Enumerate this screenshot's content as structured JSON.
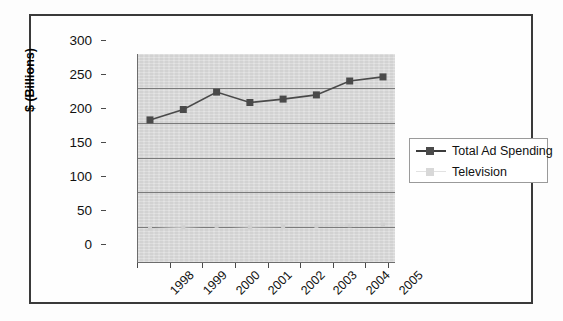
{
  "chart_data": {
    "type": "line",
    "title": "",
    "xlabel": "",
    "ylabel": "$ (Billions)",
    "categories": [
      "1998",
      "1999",
      "2000",
      "2001",
      "2002",
      "2003",
      "2004",
      "2005"
    ],
    "ylim": [
      0,
      300
    ],
    "ytick_step": 50,
    "yticks": [
      "0",
      "50",
      "100",
      "150",
      "200",
      "250",
      "300"
    ],
    "grid": "horizontal",
    "legend_position": "right",
    "series": [
      {
        "name": "Total Ad Spending",
        "marker": "square",
        "color": "#4a4a4a",
        "values": [
          205,
          220,
          245,
          230,
          235,
          241,
          261,
          267
        ]
      },
      {
        "name": "Television",
        "marker": "square",
        "color": "#d0d0d0",
        "values": [
          48,
          50,
          52,
          50,
          51,
          52,
          53,
          54
        ]
      }
    ]
  },
  "axes": {
    "y_title": "$ (Billions)",
    "y_tick_labels": [
      "300",
      "250",
      "200",
      "150",
      "100",
      "50",
      "0"
    ],
    "x_tick_labels": [
      "1998",
      "1999",
      "2000",
      "2001",
      "2002",
      "2003",
      "2004",
      "2005"
    ]
  },
  "legend": {
    "entries": [
      {
        "label": "Total Ad Spending",
        "color": "#4a4a4a",
        "marker_icon": "square-marker-icon"
      },
      {
        "label": "Television",
        "color": "#d8d8d8",
        "marker_icon": "square-marker-icon"
      }
    ]
  },
  "colors": {
    "plot_background": "#d9d9d9",
    "gridline": "#7b7b7b",
    "frame": "#3a3a3a",
    "series_primary": "#4a4a4a",
    "series_secondary": "#d8d8d8",
    "page_background": "#ffffff"
  }
}
